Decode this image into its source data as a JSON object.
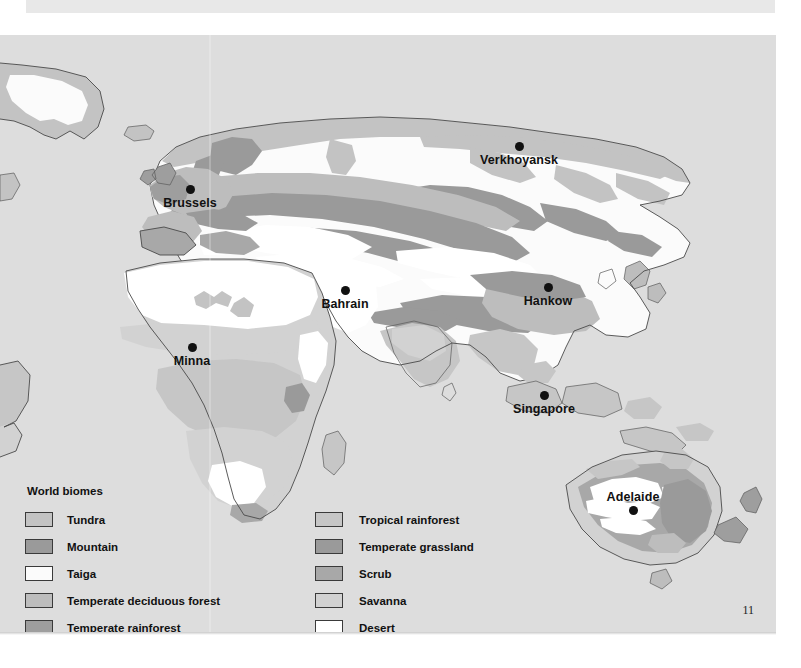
{
  "page": {
    "folio": "11",
    "background_color": "#dddddd",
    "paper_color": "#ffffff"
  },
  "map": {
    "name": "world-biomes-map",
    "projection_note": "world map, Europe-Africa-Asia-Australia visible",
    "cities": [
      {
        "name": "Verkhoyansk",
        "x": 519,
        "y": 112,
        "label_position": "below"
      },
      {
        "name": "Brussels",
        "x": 190,
        "y": 155,
        "label_position": "below"
      },
      {
        "name": "Bahrain",
        "x": 345,
        "y": 256,
        "label_position": "below"
      },
      {
        "name": "Hankow",
        "x": 548,
        "y": 253,
        "label_position": "below"
      },
      {
        "name": "Minna",
        "x": 192,
        "y": 313,
        "label_position": "below"
      },
      {
        "name": "Singapore",
        "x": 544,
        "y": 361,
        "label_position": "below"
      },
      {
        "name": "Adelaide",
        "x": 633,
        "y": 489,
        "label_position": "above"
      }
    ]
  },
  "legend": {
    "title": "World biomes",
    "columns": [
      {
        "items": [
          {
            "label": "Tundra",
            "color": "#c3c3c3"
          },
          {
            "label": "Mountain",
            "color": "#9a9a9a"
          },
          {
            "label": "Taiga",
            "color": "#fbfbfb"
          },
          {
            "label": "Temperate deciduous forest",
            "color": "#bdbdbd"
          },
          {
            "label": "Temperate rainforest",
            "color": "#9e9e9e"
          }
        ]
      },
      {
        "items": [
          {
            "label": "Tropical rainforest",
            "color": "#c6c6c6"
          },
          {
            "label": "Temperate grassland",
            "color": "#9a9a9a"
          },
          {
            "label": "Scrub",
            "color": "#a8a8a8"
          },
          {
            "label": "Savanna",
            "color": "#d2d2d2"
          },
          {
            "label": "Desert",
            "color": "#ffffff"
          }
        ]
      }
    ]
  }
}
